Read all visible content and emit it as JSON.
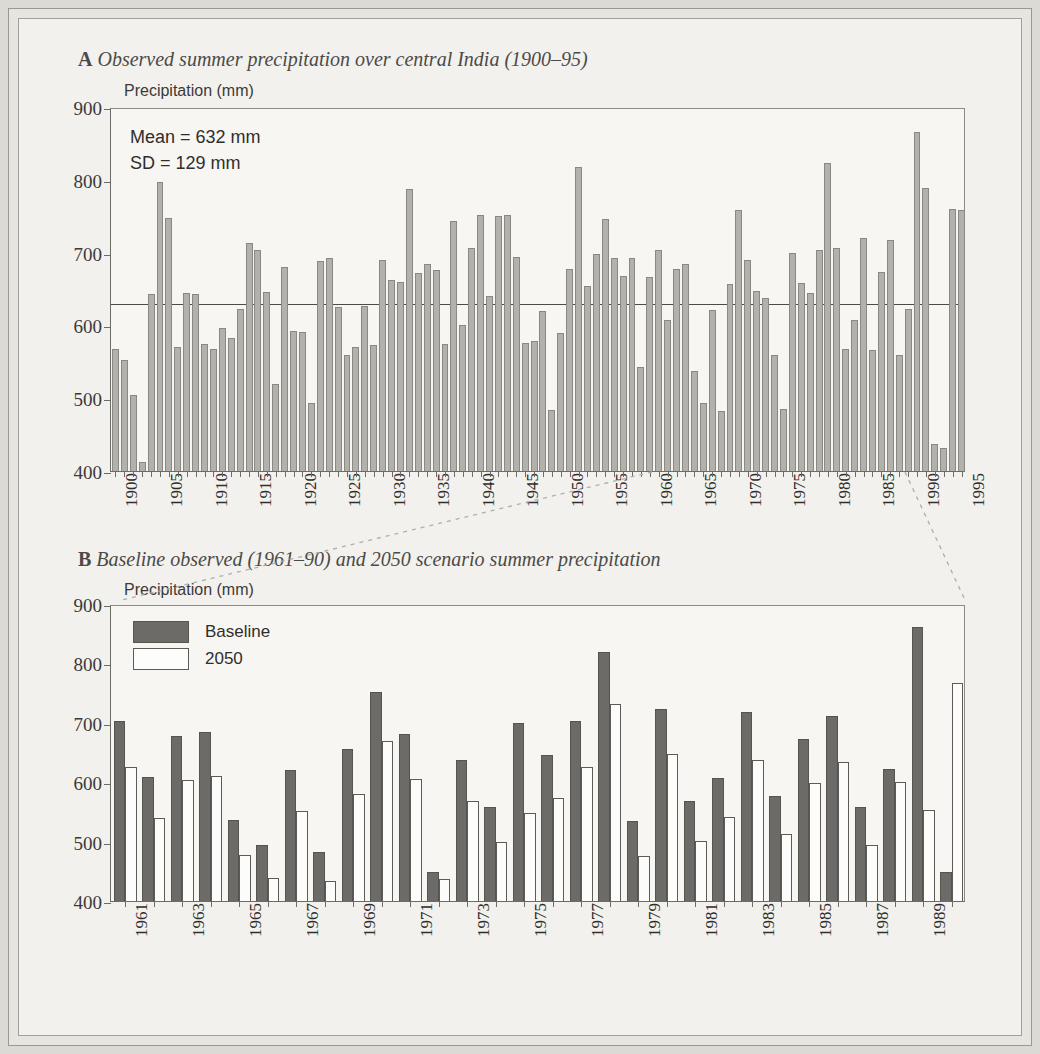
{
  "figure": {
    "background_color": "#f2f1ed",
    "bar_color_observed": "#b3b1ac",
    "bar_color_baseline": "#6d6b68",
    "bar_color_2050": "#ffffff"
  },
  "panelA": {
    "tag": "A",
    "title": "Observed summer precipitation over central India (1900–95)",
    "ylabel": "Precipitation (mm)",
    "annotation_mean": "Mean = 632 mm",
    "annotation_sd": "SD = 129 mm"
  },
  "panelB": {
    "tag": "B",
    "title": "Baseline observed (1961–90) and 2050 scenario summer precipitation",
    "ylabel": "Precipitation (mm)",
    "legend": [
      {
        "label": "Baseline",
        "style": "base"
      },
      {
        "label": "2050",
        "style": "scen"
      }
    ]
  },
  "chart_data": [
    {
      "type": "bar",
      "id": "panel-a",
      "title": "Observed summer precipitation over central India (1900–95)",
      "xlabel": "",
      "ylabel": "Precipitation (mm)",
      "ylim": [
        400,
        900
      ],
      "yticks": [
        400,
        500,
        600,
        700,
        800,
        900
      ],
      "grid": false,
      "legend": "none",
      "mean": 632,
      "sd": 129,
      "mean_line": 632,
      "xticks": [
        1900,
        1905,
        1910,
        1915,
        1920,
        1925,
        1930,
        1935,
        1940,
        1945,
        1950,
        1955,
        1960,
        1965,
        1970,
        1975,
        1980,
        1985,
        1990,
        1995
      ],
      "categories": [
        1900,
        1901,
        1902,
        1903,
        1904,
        1905,
        1906,
        1907,
        1908,
        1909,
        1910,
        1911,
        1912,
        1913,
        1914,
        1915,
        1916,
        1917,
        1918,
        1919,
        1920,
        1921,
        1922,
        1923,
        1924,
        1925,
        1926,
        1927,
        1928,
        1929,
        1930,
        1931,
        1932,
        1933,
        1934,
        1935,
        1936,
        1937,
        1938,
        1939,
        1940,
        1941,
        1942,
        1943,
        1944,
        1945,
        1946,
        1947,
        1948,
        1949,
        1950,
        1951,
        1952,
        1953,
        1954,
        1955,
        1956,
        1957,
        1958,
        1959,
        1960,
        1961,
        1962,
        1963,
        1964,
        1965,
        1966,
        1967,
        1968,
        1969,
        1970,
        1971,
        1972,
        1973,
        1974,
        1975,
        1976,
        1977,
        1978,
        1979,
        1980,
        1981,
        1982,
        1983,
        1984,
        1985,
        1986,
        1987,
        1988,
        1989,
        1990,
        1991,
        1992,
        1993,
        1994,
        1995
      ],
      "values": [
        568,
        552,
        505,
        412,
        643,
        797,
        748,
        571,
        645,
        643,
        575,
        568,
        596,
        583,
        623,
        713,
        703,
        646,
        520,
        680,
        592,
        591,
        494,
        689,
        693,
        625,
        560,
        571,
        627,
        573,
        690,
        662,
        660,
        788,
        672,
        684,
        676,
        575,
        743,
        600,
        707,
        752,
        640,
        750,
        752,
        694,
        576,
        578,
        620,
        484,
        590,
        678,
        817,
        654,
        698,
        746,
        692,
        668,
        692,
        543,
        667,
        704,
        608,
        678,
        684,
        537,
        494,
        621,
        482,
        657,
        758,
        690,
        647,
        637,
        559,
        485,
        700,
        658,
        645,
        703,
        823,
        707,
        568,
        607,
        720,
        566,
        673,
        718,
        559,
        623,
        866,
        789,
        437,
        432,
        760,
        758
      ]
    },
    {
      "type": "bar",
      "id": "panel-b",
      "title": "Baseline observed (1961–90) and 2050 scenario summer precipitation",
      "xlabel": "",
      "ylabel": "Precipitation (mm)",
      "ylim": [
        400,
        900
      ],
      "yticks": [
        400,
        500,
        600,
        700,
        800,
        900
      ],
      "grid": false,
      "legend": "upper-left",
      "xticks": [
        1961,
        1963,
        1965,
        1967,
        1969,
        1971,
        1973,
        1975,
        1977,
        1979,
        1981,
        1983,
        1985,
        1987,
        1989
      ],
      "categories": [
        1961,
        1962,
        1963,
        1964,
        1965,
        1966,
        1967,
        1968,
        1969,
        1970,
        1971,
        1972,
        1973,
        1974,
        1975,
        1976,
        1977,
        1978,
        1979,
        1980,
        1981,
        1982,
        1983,
        1984,
        1985,
        1986,
        1987,
        1988,
        1989,
        1990
      ],
      "series": [
        {
          "name": "Baseline",
          "values": [
            703,
            609,
            678,
            684,
            537,
            494,
            621,
            482,
            656,
            752,
            681,
            449,
            637,
            558,
            700,
            645,
            703,
            819,
            534,
            724,
            568,
            607,
            718,
            577,
            673,
            711,
            559,
            622,
            862,
            449
          ]
        },
        {
          "name": "2050",
          "values": [
            626,
            540,
            604,
            611,
            478,
            439,
            551,
            434,
            581,
            669,
            605,
            437,
            568,
            500,
            549,
            574,
            626,
            731,
            476,
            648,
            501,
            541,
            637,
            512,
            598,
            634,
            495,
            600,
            553,
            767
          ]
        }
      ]
    }
  ]
}
